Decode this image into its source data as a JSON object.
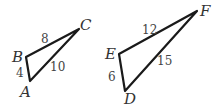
{
  "triangles": [
    {
      "vertices": {
        "A": "A",
        "B": "B",
        "C": "C"
      },
      "sides": {
        "AB": "4",
        "BC": "8",
        "AC": "10"
      }
    },
    {
      "vertices": {
        "D": "D",
        "E": "E",
        "F": "F"
      },
      "sides": {
        "DE": "6",
        "EF": "12",
        "DF": "15"
      }
    }
  ],
  "colors": {
    "stroke": "#1a1a1a",
    "text": "#333333"
  }
}
